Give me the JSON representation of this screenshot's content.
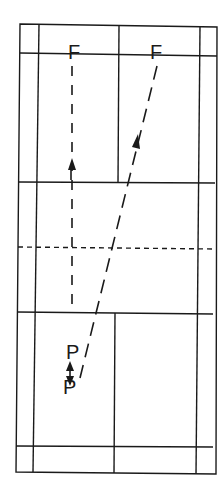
{
  "diagram": {
    "type": "badminton-court-shot-paths",
    "colors": {
      "line": "#1a1a1a",
      "background": "#ffffff"
    },
    "labels": {
      "front_left": "F",
      "front_right": "F",
      "player_top": "P",
      "player_bottom": "P"
    },
    "court": {
      "outer": {
        "x1": 20,
        "y1": 24,
        "x2": 216,
        "y2": 474
      },
      "side_lines_x": [
        37,
        199
      ],
      "back_line_top_y": 54,
      "short_service_top_y": 182,
      "net_y": 248,
      "short_service_bottom_y": 312,
      "long_service_bottom_y": 446
    },
    "paths": [
      {
        "name": "straight-shot",
        "from": [
          72,
          352
        ],
        "to": [
          72,
          66
        ],
        "style": "dashed",
        "arrow_at": [
          72,
          165
        ]
      },
      {
        "name": "cross-court-shot",
        "from": [
          80,
          380
        ],
        "to": [
          157,
          66
        ],
        "style": "dashed",
        "arrow_at": [
          136,
          140
        ]
      },
      {
        "name": "player-movement",
        "from": [
          71,
          368
        ],
        "to": [
          71,
          382
        ],
        "style": "double-arrow"
      }
    ]
  }
}
